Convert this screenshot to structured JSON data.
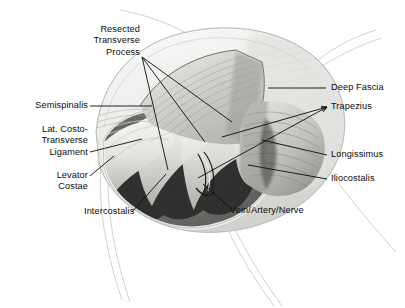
{
  "figure": {
    "kind": "anatomical-illustration",
    "style": "pencil / graphite medical illustration, grayscale",
    "background_color": "#ffffff",
    "ink_color": "#0b0b0d",
    "palette": {
      "paper": "#ffffff",
      "fascia_light": "#e9e9e6",
      "muscle_mid": "#9a9a96",
      "muscle_dark": "#4c4c4a",
      "intercostal_shadow": "#2a2a29",
      "rib_highlight": "#f2f2ef",
      "retractor_edge": "#d8d8d4"
    }
  },
  "labels": [
    {
      "id": "resected-transverse-process",
      "text": "Resected\nTransverse\nProcess",
      "align": "right",
      "x": 30,
      "y": 24,
      "width": 110,
      "leaders": 3
    },
    {
      "id": "semispinalis",
      "text": "Semispinalis",
      "align": "right",
      "x": 8,
      "y": 100,
      "width": 80,
      "leaders": 1
    },
    {
      "id": "lat-costo-transverse-ligament",
      "text": "Lat. Costo-\nTransverse\nLigament",
      "align": "right",
      "x": 8,
      "y": 124,
      "width": 80,
      "leaders": 1
    },
    {
      "id": "levator-costae",
      "text": "Levator\nCostae",
      "align": "right",
      "x": 22,
      "y": 170,
      "width": 66,
      "leaders": 1
    },
    {
      "id": "intercostalis",
      "text": "Intercostalis",
      "align": "left",
      "x": 84,
      "y": 214,
      "width": 80,
      "leaders": 1
    },
    {
      "id": "vein-artery-nerve",
      "text": "Vein/Artery/Nerve",
      "align": "left",
      "x": 230,
      "y": 211,
      "width": 110,
      "leaders": 1
    },
    {
      "id": "deep-fascia",
      "text": "Deep Fascia",
      "align": "left",
      "x": 331,
      "y": 82,
      "width": 72,
      "leaders": 1
    },
    {
      "id": "trapezius",
      "text": "Trapezius",
      "align": "left",
      "x": 331,
      "y": 101,
      "width": 72,
      "leaders": 2
    },
    {
      "id": "longissimus",
      "text": "Longissimus",
      "align": "left",
      "x": 331,
      "y": 150,
      "width": 72,
      "leaders": 1
    },
    {
      "id": "iliocostalis",
      "text": "Iliocostalis",
      "align": "left",
      "x": 331,
      "y": 174,
      "width": 72,
      "leaders": 1
    }
  ]
}
